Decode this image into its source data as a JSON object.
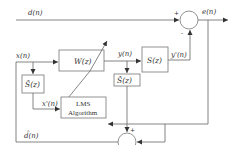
{
  "diagram": {
    "signals": {
      "d": "d(n)",
      "e": "e(n)",
      "x": "x(n)",
      "y": "y(n)",
      "y_prime": "y'(n)",
      "x_prime": "x'(n)",
      "d_hat": "d̂(n)"
    },
    "blocks": {
      "W": "W(z)",
      "S": "S(z)",
      "S_hat_left": "Ŝ(z)",
      "S_hat_right": "Ŝ(z)",
      "lms_line1": "LMS",
      "lms_line2": "Algorithm"
    },
    "junctions": {
      "top_plus": "+",
      "top_minus": "-",
      "bottom_plus_top": "+",
      "bottom_plus_right": "+"
    },
    "colors": {
      "line": "#666666",
      "text": "#333333",
      "background": "#ffffff"
    }
  }
}
